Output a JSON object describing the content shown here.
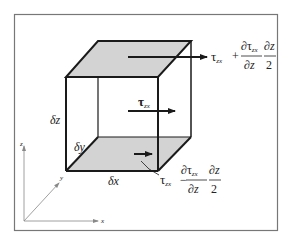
{
  "diagram": {
    "colors": {
      "line": "#1a1a1a",
      "shade": "#d3d3d3",
      "frame": "#777777",
      "axis": "#888888"
    },
    "labels": {
      "dz": "δz",
      "dy": "δy",
      "dx": "δx",
      "tau_mid": "τ",
      "tau_mid_sub": "zx",
      "top_tau": "τ",
      "top_tau_sub": "zx",
      "top_op": "+",
      "top_num": "∂τ",
      "top_num_sub": "zx",
      "top_den": "∂z",
      "top_num2": "∂z",
      "top_den2": "2",
      "bot_tau": "τ",
      "bot_tau_sub": "zx",
      "bot_op": "−",
      "bot_num": "∂τ",
      "bot_num_sub": "zx",
      "bot_den": "∂z",
      "bot_num2": "∂z",
      "bot_den2": "2"
    },
    "axes": {
      "x": "x",
      "y": "y",
      "z": "z"
    }
  }
}
